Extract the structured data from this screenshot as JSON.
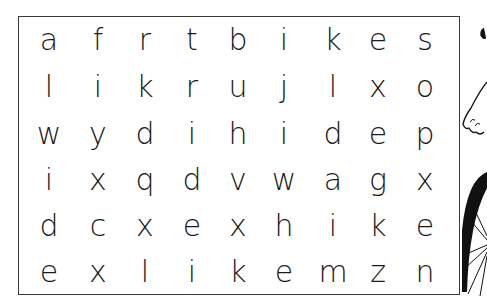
{
  "puzzle": {
    "type": "word-search",
    "rows": [
      [
        "a",
        "f",
        "r",
        "t",
        "b",
        "i",
        "k",
        "e",
        "s"
      ],
      [
        "l",
        "i",
        "k",
        "r",
        "u",
        "j",
        "l",
        "x",
        "o"
      ],
      [
        "w",
        "y",
        "d",
        "i",
        "h",
        "i",
        "d",
        "e",
        "p"
      ],
      [
        "i",
        "x",
        "q",
        "d",
        "v",
        "w",
        "a",
        "g",
        "x"
      ],
      [
        "d",
        "c",
        "x",
        "e",
        "x",
        "h",
        "i",
        "k",
        "e"
      ],
      [
        "e",
        "x",
        "l",
        "i",
        "k",
        "e",
        "m",
        "z",
        "n"
      ]
    ]
  },
  "illustration": {
    "subject": "cartoon hand and bicycle wheel",
    "colors": {
      "ink": "#111111"
    }
  }
}
